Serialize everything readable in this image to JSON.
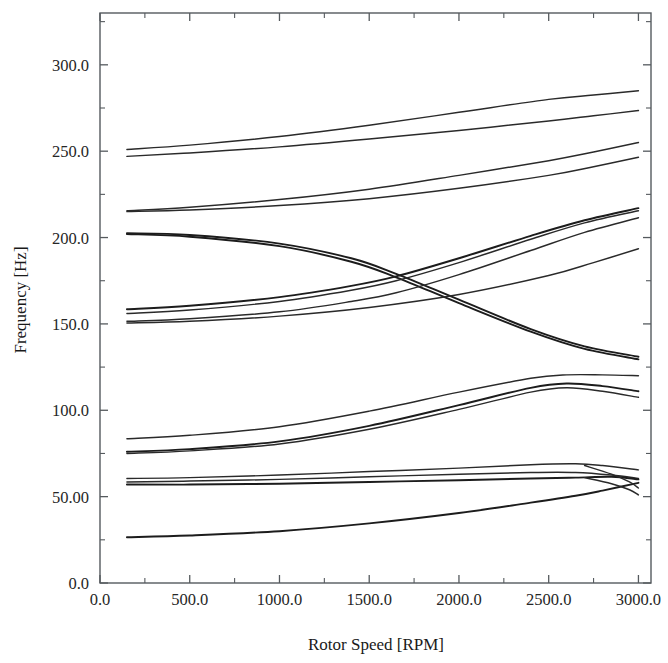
{
  "figure": {
    "kind": "campbell-diagram",
    "background": "#ffffff",
    "ink": "#2a2a2a",
    "frame": {
      "left": 100,
      "right": 651,
      "top": 13,
      "bottom": 583
    }
  },
  "chart_data": {
    "type": "line",
    "title": "",
    "subtitle": "",
    "xlabel": "Rotor Speed [RPM]",
    "ylabel": "Frequency [Hz]",
    "xlim": [
      0,
      3070
    ],
    "ylim": [
      0,
      330
    ],
    "grid": false,
    "legend": "none",
    "xticks": [
      0,
      500,
      1000,
      1500,
      2000,
      2500,
      3000
    ],
    "xtick_labels": [
      "0.0",
      "500.0",
      "1000.0",
      "1500.0",
      "2000.0",
      "2500.0",
      "3000.0"
    ],
    "xminor_step": 250,
    "yticks": [
      0,
      50,
      100,
      150,
      200,
      250,
      300
    ],
    "ytick_labels": [
      "0.0",
      "50.00",
      "100.0",
      "150.0",
      "200.0",
      "250.0",
      "300.0"
    ],
    "yminor_step": 25,
    "x_domain_of_curves": [
      150,
      3000
    ],
    "annotations": [
      {
        "text": "mode crossing",
        "x": 1650,
        "y": 178
      },
      {
        "text": "closed whirl loop",
        "x": 2770,
        "y": 60
      }
    ],
    "series": [
      {
        "name": "mode-16-forward",
        "weight": "normal",
        "x": [
          150,
          500,
          1000,
          1500,
          2000,
          2500,
          2750,
          3000
        ],
        "y": [
          251.0,
          253.5,
          258.5,
          265.0,
          272.5,
          280.0,
          282.5,
          285.0
        ]
      },
      {
        "name": "mode-15-backward",
        "weight": "normal",
        "x": [
          150,
          500,
          1000,
          1500,
          2000,
          2500,
          2750,
          3000
        ],
        "y": [
          247.0,
          249.0,
          252.5,
          257.0,
          262.0,
          267.5,
          270.5,
          273.5
        ]
      },
      {
        "name": "mode-14-forward",
        "weight": "normal",
        "x": [
          150,
          500,
          1000,
          1500,
          2000,
          2500,
          2750,
          3000
        ],
        "y": [
          215.5,
          217.5,
          222.0,
          228.0,
          236.0,
          244.5,
          249.5,
          255.0
        ]
      },
      {
        "name": "mode-13-backward",
        "weight": "normal",
        "x": [
          150,
          500,
          1000,
          1500,
          2000,
          2500,
          2750,
          3000
        ],
        "y": [
          215.0,
          216.0,
          218.5,
          222.5,
          228.5,
          236.0,
          241.0,
          246.5
        ]
      },
      {
        "name": "mode-12-backward-descending",
        "weight": "bold",
        "x": [
          150,
          500,
          1000,
          1400,
          1650,
          2000,
          2400,
          2700,
          3000
        ],
        "y": [
          202.5,
          201.5,
          196.5,
          188.0,
          179.0,
          164.0,
          147.0,
          137.0,
          131.0
        ]
      },
      {
        "name": "mode-11-backward-descending-pair",
        "weight": "bold",
        "x": [
          150,
          500,
          1000,
          1400,
          1650,
          2000,
          2400,
          2700,
          3000
        ],
        "y": [
          202.0,
          200.5,
          195.0,
          186.0,
          177.0,
          162.0,
          145.5,
          135.5,
          129.5
        ]
      },
      {
        "name": "mode-10-forward-rising",
        "weight": "bold",
        "x": [
          150,
          500,
          1000,
          1400,
          1650,
          2000,
          2400,
          2700,
          3000
        ],
        "y": [
          158.5,
          160.5,
          165.5,
          172.0,
          177.5,
          188.0,
          201.0,
          210.0,
          217.0
        ]
      },
      {
        "name": "mode-09-forward-rising",
        "weight": "normal",
        "x": [
          150,
          500,
          1000,
          1400,
          1650,
          2000,
          2400,
          2700,
          3000
        ],
        "y": [
          156.0,
          158.0,
          163.0,
          169.5,
          175.0,
          185.5,
          199.0,
          208.5,
          215.5
        ]
      },
      {
        "name": "mode-08-forward-rising",
        "weight": "normal",
        "x": [
          150,
          500,
          1000,
          1400,
          1650,
          2000,
          2400,
          2700,
          3000
        ],
        "y": [
          151.5,
          153.0,
          157.0,
          163.0,
          168.0,
          178.5,
          192.5,
          203.0,
          211.5
        ]
      },
      {
        "name": "mode-07-shallow",
        "weight": "normal",
        "x": [
          150,
          500,
          1000,
          1500,
          2000,
          2500,
          2750,
          3000
        ],
        "y": [
          150.5,
          151.5,
          154.5,
          159.5,
          167.0,
          178.0,
          185.5,
          193.5
        ]
      },
      {
        "name": "mode-06-forward",
        "weight": "normal",
        "x": [
          150,
          500,
          1000,
          1500,
          2000,
          2400,
          2600,
          2800,
          3000
        ],
        "y": [
          83.5,
          85.5,
          90.5,
          99.5,
          110.5,
          118.5,
          120.5,
          120.5,
          120.0
        ]
      },
      {
        "name": "mode-05-forward",
        "weight": "bold",
        "x": [
          150,
          500,
          1000,
          1500,
          2000,
          2400,
          2600,
          2800,
          3000
        ],
        "y": [
          76.0,
          77.5,
          82.0,
          91.0,
          103.0,
          113.0,
          115.5,
          114.0,
          111.0
        ]
      },
      {
        "name": "mode-04-forward-lower",
        "weight": "normal",
        "x": [
          150,
          500,
          1000,
          1500,
          2000,
          2400,
          2600,
          2800,
          3000
        ],
        "y": [
          75.0,
          76.5,
          80.5,
          89.0,
          100.5,
          110.5,
          113.0,
          111.0,
          107.5
        ]
      },
      {
        "name": "mode-03-loop-upper",
        "weight": "normal",
        "x": [
          150,
          500,
          1000,
          1500,
          2000,
          2400,
          2650,
          2800,
          3000
        ],
        "y": [
          60.5,
          61.0,
          62.5,
          64.5,
          66.5,
          68.5,
          69.0,
          68.0,
          65.5
        ]
      },
      {
        "name": "mode-02-loop-mid",
        "weight": "normal",
        "x": [
          150,
          500,
          1000,
          1500,
          2000,
          2400,
          2650,
          2850,
          3000
        ],
        "y": [
          58.5,
          59.0,
          60.0,
          61.5,
          63.0,
          64.0,
          64.0,
          62.5,
          60.5
        ]
      },
      {
        "name": "mode-01-loop-lower",
        "weight": "bold",
        "x": [
          150,
          500,
          1000,
          1500,
          2000,
          2400,
          2650,
          2850,
          3000
        ],
        "y": [
          57.0,
          57.0,
          57.5,
          58.5,
          59.5,
          60.5,
          61.0,
          61.5,
          60.0
        ]
      },
      {
        "name": "mode-00-backward-rising",
        "weight": "bold",
        "x": [
          150,
          500,
          1000,
          1500,
          2000,
          2400,
          2650,
          2800,
          3000
        ],
        "y": [
          26.5,
          27.5,
          30.0,
          34.5,
          40.5,
          46.5,
          50.5,
          53.5,
          58.0
        ]
      },
      {
        "name": "mode-loop-return-upper",
        "weight": "normal",
        "x": [
          2700,
          2850,
          2950,
          3000
        ],
        "y": [
          68.0,
          63.0,
          58.5,
          55.0
        ]
      },
      {
        "name": "mode-loop-return-lower",
        "weight": "normal",
        "x": [
          2700,
          2850,
          2950,
          3000
        ],
        "y": [
          61.0,
          57.5,
          54.0,
          51.0
        ]
      }
    ]
  }
}
